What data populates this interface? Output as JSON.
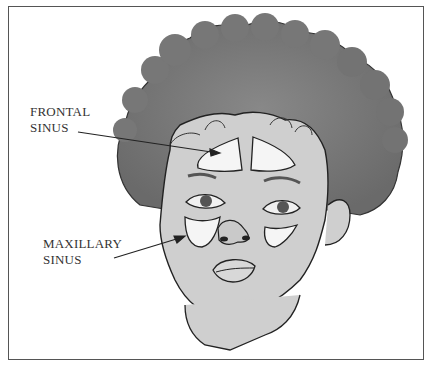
{
  "figure": {
    "labels": [
      {
        "id": "frontal",
        "line1": "FRONTAL",
        "line2": "SINUS"
      },
      {
        "id": "maxillary",
        "line1": "MAXILLARY",
        "line2": "SINUS"
      }
    ]
  },
  "colors": {
    "hair": "#7a7a7a",
    "skin": "#cfcfcf",
    "sinus": "#f5f5f5",
    "outline": "#222222",
    "border": "#555555",
    "text": "#333333"
  }
}
